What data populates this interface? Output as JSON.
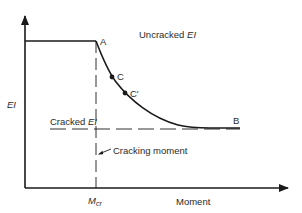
{
  "diagram": {
    "axes": {
      "y_label": "EI",
      "x_label": "Moment",
      "x_tick_label_main": "M",
      "x_tick_label_sub": "cr"
    },
    "regions": {
      "uncracked_main": "Uncracked ",
      "uncracked_em": "EI",
      "cracked_main": "Cracked ",
      "cracked_em": "EI"
    },
    "annotations": {
      "cracking_moment": "Cracking moment"
    },
    "points": [
      {
        "id": "A",
        "label": "A",
        "description": "Onset of cracking at Mcr on uncracked EI"
      },
      {
        "id": "C",
        "label": "C",
        "description": "Intermediate point on transition curve"
      },
      {
        "id": "Cprime",
        "label": "C′",
        "description": "Second intermediate point on transition curve"
      },
      {
        "id": "B",
        "label": "B",
        "description": "Curve converges to cracked EI"
      }
    ],
    "colors": {
      "line": "#1a1a1a",
      "text": "#2a2a2a",
      "background": "#ffffff"
    }
  }
}
